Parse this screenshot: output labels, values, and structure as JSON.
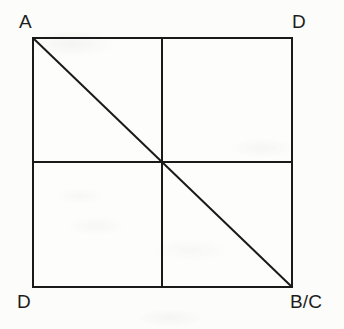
{
  "figure": {
    "background_color": "#fcfcfa",
    "stroke_color": "#1a1a1a",
    "square": {
      "x": 33,
      "y": 38,
      "width": 259,
      "height": 249,
      "stroke_width": 2
    },
    "midlines": {
      "vertical_x": 162,
      "horizontal_y": 162,
      "stroke_width": 2
    },
    "diagonal": {
      "from": "top-left",
      "to": "bottom-right",
      "x1": 33,
      "y1": 38,
      "x2": 292,
      "y2": 287,
      "stroke_width": 2
    },
    "corner_labels": {
      "top_left": "A",
      "top_right": "D",
      "bottom_left": "D",
      "bottom_right": "B/C"
    }
  }
}
